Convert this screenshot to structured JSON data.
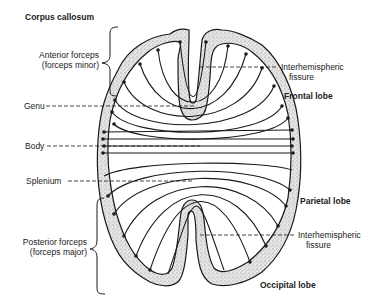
{
  "title": "Corpus callosum",
  "labels": {
    "anterior_forceps": [
      "Anterior forceps",
      "(forceps minor)"
    ],
    "genu": "Genu",
    "body": "Body",
    "splenium": "Splenium",
    "posterior_forceps": [
      "Posterior forceps",
      "(forceps major)"
    ],
    "fissure_top": [
      "Interhemispheric",
      "fissure"
    ],
    "frontal_lobe": "Frontal lobe",
    "parietal_lobe": "Parietal lobe",
    "fissure_bottom": [
      "Interhemispheric",
      "fissure"
    ],
    "occipital_lobe": "Occipital lobe"
  },
  "colors": {
    "ink": "#1a1a1a",
    "cortex_stipple": "#bdbdbd",
    "background": "#ffffff"
  }
}
